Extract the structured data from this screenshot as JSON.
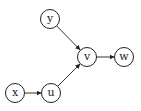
{
  "diagram": {
    "type": "directed-graph",
    "nodes": [
      {
        "id": "y",
        "label": "y",
        "x": 50,
        "y": 19
      },
      {
        "id": "v",
        "label": "v",
        "x": 87,
        "y": 57
      },
      {
        "id": "w",
        "label": "w",
        "x": 124,
        "y": 57
      },
      {
        "id": "x",
        "label": "x",
        "x": 15,
        "y": 93
      },
      {
        "id": "u",
        "label": "u",
        "x": 51,
        "y": 93
      }
    ],
    "edges": [
      {
        "from": "y",
        "to": "v"
      },
      {
        "from": "v",
        "to": "w"
      },
      {
        "from": "x",
        "to": "u"
      },
      {
        "from": "u",
        "to": "v"
      }
    ]
  }
}
